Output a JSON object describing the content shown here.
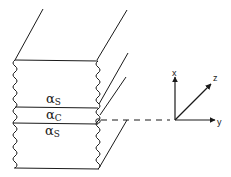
{
  "diagram": {
    "type": "layered-waveguide-schematic",
    "layers": [
      {
        "name": "upper-cladding",
        "symbol": "α",
        "subscript": "S"
      },
      {
        "name": "core",
        "symbol": "α",
        "subscript": "C"
      },
      {
        "name": "lower-cladding",
        "symbol": "α",
        "subscript": "S"
      }
    ],
    "axes": {
      "x_label": "x",
      "y_label": "y",
      "z_label": "z"
    },
    "colors": {
      "stroke": "#1a1a1a",
      "background": "#ffffff"
    }
  }
}
